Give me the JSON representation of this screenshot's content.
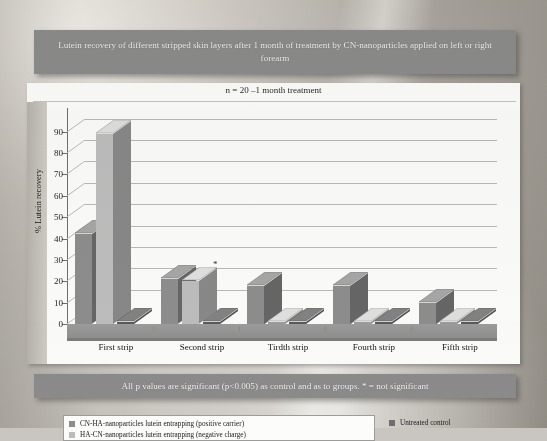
{
  "slide": {
    "title": "Lutein recovery of different stripped skin layers after 1 month of treatment by CN-nanoparticles applied on left or right forearm",
    "footer": "All p values are significant (p<0.005) as control and as to groups.    * = not significant"
  },
  "chart_data": {
    "type": "bar",
    "title": "n = 20 –1 month treatment",
    "xlabel": "",
    "ylabel": "% Lutein recovery",
    "ylim": [
      0,
      95
    ],
    "yticks": [
      0,
      10,
      20,
      30,
      40,
      50,
      60,
      70,
      80,
      90
    ],
    "grid": true,
    "legend_position": "bottom",
    "categories": [
      "First strip",
      "Second strip",
      "Tirdth strip",
      "Fourth strip",
      "Fifth strip"
    ],
    "series": [
      {
        "name": "CN-HA-nanoparticles lutein entrapping (positive carrier)",
        "color": "#8d8d8d",
        "values": [
          42,
          21,
          18,
          18,
          10
        ]
      },
      {
        "name": "HA-CN-nanoparticles lutein entrapping (negative charge)",
        "color": "#bdbdbd",
        "values": [
          89,
          20,
          0,
          0,
          0
        ]
      },
      {
        "name": "Untreated control",
        "color": "#6e6e6e",
        "values": [
          0,
          0,
          0,
          0,
          0
        ]
      }
    ],
    "annotations": [
      {
        "text": "*",
        "category": "Second strip",
        "series": "HA-CN-nanoparticles lutein entrapping (negative charge)",
        "value": 20
      }
    ]
  },
  "colors": {
    "banner": "#8b8b8b",
    "banner_text": "#f4f4f2",
    "series_positive": "#8d8d8d",
    "series_negative": "#bdbdbd",
    "series_control": "#6e6e6e",
    "gridline": "#b9b9b9",
    "plot_background": "#fbfbfa"
  }
}
